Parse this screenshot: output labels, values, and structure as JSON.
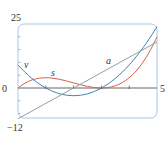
{
  "chart_data": {
    "type": "line",
    "title": "",
    "xlabel": "",
    "ylabel": "",
    "xlim": [
      0,
      5
    ],
    "ylim": [
      -12,
      25
    ],
    "grid": false,
    "legend": "inline labels",
    "y_tick_labels": [
      "25",
      "0",
      "−12"
    ],
    "x_tick_labels": [
      "5"
    ],
    "x_ticks": [
      1,
      2,
      3,
      4
    ],
    "y_ticks": [
      -10,
      -5,
      5,
      10,
      15,
      20
    ],
    "series": [
      {
        "name": "s",
        "color": "#d4634a",
        "x": [
          0,
          0.25,
          0.5,
          0.75,
          1,
          1.25,
          1.5,
          1.75,
          2,
          2.25,
          2.5,
          2.75,
          3,
          3.25,
          3.5,
          3.75,
          4,
          4.25,
          4.5,
          4.75,
          5
        ],
        "values": [
          0,
          1.89,
          3.13,
          3.8,
          4,
          3.83,
          3.38,
          2.73,
          2,
          1.27,
          0.63,
          0.17,
          0,
          0.2,
          0.88,
          2.11,
          4,
          6.64,
          10.13,
          14.55,
          20
        ]
      },
      {
        "name": "v",
        "color": "#3f7fc1",
        "x": [
          0,
          0.25,
          0.5,
          0.75,
          1,
          1.25,
          1.5,
          1.75,
          2,
          2.25,
          2.5,
          2.75,
          3,
          3.25,
          3.5,
          3.75,
          4,
          4.25,
          4.5,
          4.75,
          5
        ],
        "values": [
          9,
          6.19,
          3.75,
          1.69,
          0,
          -1.31,
          -2.25,
          -2.81,
          -3,
          -2.81,
          -2.25,
          -1.31,
          0,
          1.69,
          3.75,
          6.19,
          9,
          12.19,
          15.75,
          19.69,
          24
        ]
      },
      {
        "name": "a",
        "color": "#8fa39a",
        "x": [
          0,
          5
        ],
        "values": [
          -12,
          18
        ]
      }
    ],
    "labels": {
      "s": "s",
      "v": "v",
      "a": "a"
    }
  },
  "frame_color": "#a9c7e3",
  "axis_color": "#555555"
}
